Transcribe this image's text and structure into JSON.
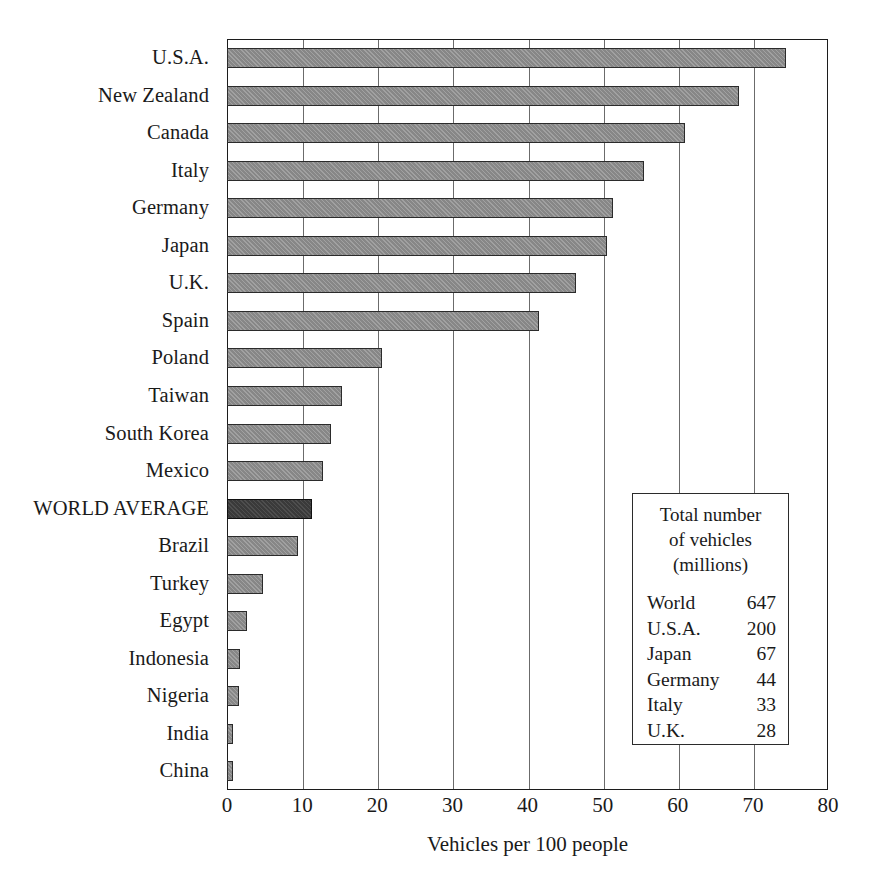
{
  "chart_data": {
    "type": "bar",
    "orientation": "horizontal",
    "title": "",
    "xlabel": "Vehicles per 100 people",
    "ylabel": "",
    "xlim": [
      0,
      80
    ],
    "xticks": [
      0,
      10,
      20,
      30,
      40,
      50,
      60,
      70,
      80
    ],
    "grid": "vertical",
    "legend_position": "inside-lower-right",
    "categories": [
      "U.S.A.",
      "New Zealand",
      "Canada",
      "Italy",
      "Germany",
      "Japan",
      "U.K.",
      "Spain",
      "Poland",
      "Taiwan",
      "South Korea",
      "Mexico",
      "WORLD AVERAGE",
      "Brazil",
      "Turkey",
      "Egypt",
      "Indonesia",
      "Nigeria",
      "India",
      "China"
    ],
    "values": [
      74.4,
      68.2,
      61.0,
      55.5,
      51.4,
      50.6,
      46.4,
      41.5,
      20.6,
      15.3,
      13.8,
      12.8,
      11.3,
      9.5,
      4.8,
      2.7,
      1.7,
      1.6,
      0.8,
      0.8
    ],
    "highlight_category": "WORLD AVERAGE",
    "colors": {
      "bar": "#878787",
      "bar_border": "#2b2b2b",
      "highlight_bar": "#3a3a3a",
      "axis": "#1c1c1c",
      "gridline": "#6b6b6b",
      "text": "#1a1a1a",
      "background": "#ffffff"
    }
  },
  "legend": {
    "title_lines": [
      "Total number",
      "of vehicles",
      "(millions)"
    ],
    "rows": [
      {
        "name": "World",
        "value": "647"
      },
      {
        "name": "U.S.A.",
        "value": "200"
      },
      {
        "name": "Japan",
        "value": "67"
      },
      {
        "name": "Germany",
        "value": "44"
      },
      {
        "name": "Italy",
        "value": "33"
      },
      {
        "name": "U.K.",
        "value": "28"
      }
    ]
  }
}
